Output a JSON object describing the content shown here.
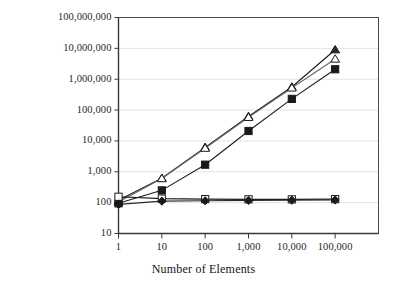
{
  "chart_data": {
    "type": "line",
    "title": "",
    "subtitle": "",
    "xlabel": "Number of Elements",
    "ylabel": "",
    "xscale": "log",
    "yscale": "log",
    "xlim": [
      1,
      1000000
    ],
    "ylim": [
      10,
      100000000
    ],
    "grid": "horizontal",
    "legend": "none",
    "x": [
      1,
      10,
      100,
      1000,
      10000,
      100000
    ],
    "xtick_labels": [
      "1",
      "10",
      "100",
      "1,000",
      "10,000",
      "100,000"
    ],
    "ytick_labels": [
      "100,000,000",
      "10,000,000",
      "1,000,000",
      "100,000",
      "10,000",
      "1,000",
      "100",
      "10"
    ],
    "ytick_values": [
      100000000,
      10000000,
      1000000,
      100000,
      10000,
      1000,
      100,
      10
    ],
    "series": [
      {
        "name": "series-filled-triangle",
        "marker": "filled-triangle",
        "color": "#1a1a1a",
        "values": [
          120,
          620,
          6200,
          62000,
          560000,
          9000000
        ]
      },
      {
        "name": "series-open-triangle",
        "marker": "open-triangle",
        "color": "#6b6b6b",
        "values": [
          105,
          600,
          5800,
          58000,
          520000,
          4500000
        ]
      },
      {
        "name": "series-filled-square",
        "marker": "filled-square",
        "color": "#1a1a1a",
        "values": [
          95,
          250,
          1700,
          21000,
          230000,
          2100000
        ]
      },
      {
        "name": "series-open-square",
        "marker": "open-square",
        "color": "#1a1a1a",
        "values": [
          155,
          135,
          130,
          128,
          128,
          130
        ]
      },
      {
        "name": "series-filled-diamond",
        "marker": "filled-diamond",
        "color": "#2b2b2b",
        "values": [
          88,
          112,
          115,
          118,
          120,
          122
        ]
      }
    ],
    "colors": {
      "axis": "#4a4a4a",
      "grid": "#e2e2e2",
      "plot_background": "#ffffff",
      "text": "#1a1a1a"
    }
  }
}
